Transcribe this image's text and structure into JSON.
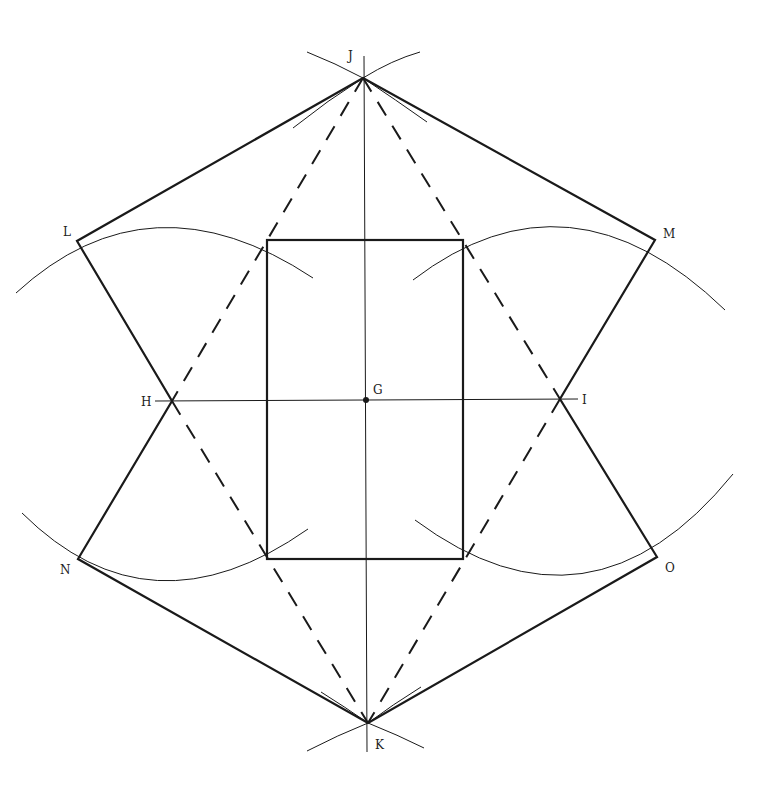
{
  "points": {
    "J": {
      "label": "J",
      "x": 363,
      "y": 78
    },
    "K": {
      "label": "K",
      "x": 368,
      "y": 723
    },
    "L": {
      "label": "L",
      "x": 77,
      "y": 241
    },
    "M": {
      "label": "M",
      "x": 655,
      "y": 240
    },
    "N": {
      "label": "N",
      "x": 78,
      "y": 559
    },
    "O": {
      "label": "O",
      "x": 657,
      "y": 557
    },
    "H": {
      "label": "H",
      "x": 172,
      "y": 401
    },
    "I": {
      "label": "I",
      "x": 560,
      "y": 399
    },
    "G": {
      "label": "G",
      "x": 366,
      "y": 400
    }
  },
  "rectangle": {
    "x1": 267,
    "y1": 240,
    "x2": 463,
    "y2": 559
  },
  "colors": {
    "line": "#1a1a1a",
    "background": "#ffffff"
  }
}
